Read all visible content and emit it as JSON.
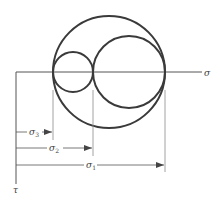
{
  "diagram": {
    "axes": {
      "horizontal_label": "σ",
      "vertical_label": "τ"
    },
    "circles": [
      {
        "name": "outer-circle",
        "between": [
          "σ3",
          "σ1"
        ]
      },
      {
        "name": "small-circle",
        "between": [
          "σ3",
          "σ2"
        ]
      },
      {
        "name": "medium-circle",
        "between": [
          "σ2",
          "σ1"
        ]
      }
    ],
    "dimensions": [
      {
        "label_base": "σ",
        "label_sub": "3"
      },
      {
        "label_base": "σ",
        "label_sub": "2"
      },
      {
        "label_base": "σ",
        "label_sub": "1"
      }
    ],
    "colors": {
      "circle_stroke": "#3a3a3a",
      "axis_stroke": "#555555",
      "leader_stroke": "#8a8a8a"
    }
  }
}
